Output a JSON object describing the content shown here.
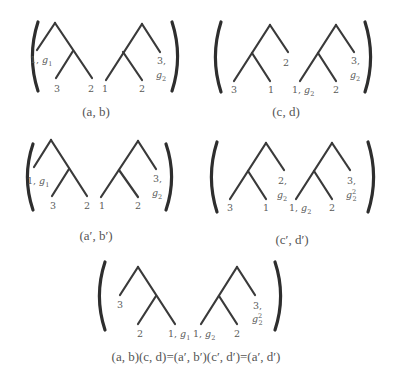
{
  "diagram": {
    "colors": {
      "edge": "#3a3a3a",
      "paren": "#2e2e2e",
      "label": "#5a5a5a",
      "caption": "#555555",
      "background": "#ffffff"
    },
    "panels": [
      {
        "id": "ab",
        "caption": "(a, b)",
        "caption_pos": [
          96,
          116
        ],
        "parens": {
          "left_x": 31,
          "right_x": 179,
          "top": 22,
          "bottom": 91
        },
        "trees": [
          {
            "edges": [
              [
                55,
                23,
                37,
                50
              ],
              [
                55,
                23,
                92,
                78
              ],
              [
                73,
                51,
                56,
                78
              ]
            ],
            "labels": [
              {
                "text": "1, ",
                "sub": "g",
                "subscript": "1",
                "x": 30,
                "y": 63
              },
              {
                "text": "3",
                "x": 54,
                "y": 92
              },
              {
                "text": "2",
                "x": 88,
                "y": 92
              }
            ]
          },
          {
            "edges": [
              [
                142,
                24,
                106,
                80
              ],
              [
                142,
                24,
                160,
                52
              ],
              [
                123,
                52,
                142,
                80
              ]
            ],
            "labels": [
              {
                "text": "1",
                "x": 102,
                "y": 92
              },
              {
                "text": "2",
                "x": 139,
                "y": 92
              },
              {
                "text": "3,",
                "x": 157,
                "y": 64
              },
              {
                "text": "",
                "sub": "g",
                "subscript": "2",
                "x": 156,
                "y": 78
              }
            ]
          }
        ]
      },
      {
        "id": "cd",
        "caption": "(c, d)",
        "caption_pos": [
          286,
          116
        ],
        "parens": {
          "left_x": 214,
          "right_x": 372,
          "top": 22,
          "bottom": 92
        },
        "trees": [
          {
            "edges": [
              [
                270,
                25,
                234,
                81
              ],
              [
                270,
                25,
                288,
                52
              ],
              [
                252,
                53,
                270,
                81
              ]
            ],
            "labels": [
              {
                "text": "3",
                "x": 231,
                "y": 93
              },
              {
                "text": "1",
                "x": 268,
                "y": 93
              },
              {
                "text": "2",
                "x": 283,
                "y": 66
              }
            ]
          },
          {
            "edges": [
              [
                336,
                25,
                300,
                81
              ],
              [
                336,
                25,
                354,
                52
              ],
              [
                318,
                53,
                336,
                81
              ]
            ],
            "labels": [
              {
                "text": "1, ",
                "sub": "g",
                "subscript": "2",
                "x": 292,
                "y": 93
              },
              {
                "text": "2",
                "x": 333,
                "y": 93
              },
              {
                "text": "3,",
                "x": 351,
                "y": 64
              },
              {
                "text": "",
                "sub": "g",
                "subscript": "2",
                "x": 350,
                "y": 78
              }
            ]
          }
        ]
      },
      {
        "id": "a-prime-b-prime",
        "caption": "(a′, b′)",
        "caption_pos": [
          96,
          240
        ],
        "parens": {
          "left_x": 26,
          "right_x": 173,
          "top": 144,
          "bottom": 210
        },
        "trees": [
          {
            "edges": [
              [
                51,
                140,
                34,
                167
              ],
              [
                51,
                140,
                87,
                196
              ],
              [
                69,
                169,
                52,
                196
              ]
            ],
            "labels": [
              {
                "text": "1, ",
                "sub": "g",
                "subscript": "1",
                "x": 27,
                "y": 184
              },
              {
                "text": "3",
                "x": 50,
                "y": 209
              },
              {
                "text": "2",
                "x": 84,
                "y": 209
              }
            ]
          },
          {
            "edges": [
              [
                138,
                141,
                101,
                197
              ],
              [
                138,
                141,
                156,
                169
              ],
              [
                119,
                170,
                138,
                197
              ]
            ],
            "labels": [
              {
                "text": "1",
                "x": 99,
                "y": 209
              },
              {
                "text": "2",
                "x": 135,
                "y": 209
              },
              {
                "text": "3,",
                "x": 153,
                "y": 182
              },
              {
                "text": "",
                "sub": "g",
                "subscript": "2",
                "x": 152,
                "y": 196
              }
            ]
          }
        ]
      },
      {
        "id": "c-prime-d-prime",
        "caption": "(c′, d′)",
        "caption_pos": [
          292,
          244
        ],
        "parens": {
          "left_x": 210,
          "right_x": 375,
          "top": 142,
          "bottom": 212
        },
        "trees": [
          {
            "edges": [
              [
                266,
                143,
                230,
                199
              ],
              [
                266,
                143,
                284,
                170
              ],
              [
                248,
                171,
                266,
                199
              ]
            ],
            "labels": [
              {
                "text": "3",
                "x": 227,
                "y": 211
              },
              {
                "text": "1",
                "x": 263,
                "y": 211
              },
              {
                "text": "2,",
                "x": 278,
                "y": 184
              },
              {
                "text": "",
                "sub": "g",
                "subscript": "2",
                "x": 277,
                "y": 198
              }
            ]
          },
          {
            "edges": [
              [
                332,
                143,
                296,
                199
              ],
              [
                332,
                143,
                350,
                170
              ],
              [
                314,
                171,
                332,
                199
              ]
            ],
            "labels": [
              {
                "text": "1, ",
                "sub": "g",
                "subscript": "2",
                "x": 289,
                "y": 211
              },
              {
                "text": "2",
                "x": 329,
                "y": 211
              },
              {
                "text": "3,",
                "x": 347,
                "y": 184
              },
              {
                "text": "",
                "sub": "g",
                "subscript": "2",
                "sup": "2",
                "x": 346,
                "y": 198
              }
            ]
          }
        ]
      },
      {
        "id": "product",
        "caption": "(a, b)(c, d)=(a′, b′)(c′, d′)=(a′, d′)",
        "caption_pos": [
          196,
          361
        ],
        "parens": {
          "left_x": 98,
          "right_x": 282,
          "top": 262,
          "bottom": 330
        },
        "trees": [
          {
            "edges": [
              [
                138,
                267,
                120,
                295
              ],
              [
                138,
                267,
                175,
                324
              ],
              [
                156,
                296,
                138,
                324
              ]
            ],
            "labels": [
              {
                "text": "3",
                "x": 117,
                "y": 308
              },
              {
                "text": "2",
                "x": 137,
                "y": 337
              },
              {
                "text": "1, ",
                "sub": "g",
                "subscript": "1",
                "x": 168,
                "y": 337
              }
            ]
          },
          {
            "edges": [
              [
                237,
                267,
                201,
                324
              ],
              [
                237,
                267,
                255,
                295
              ],
              [
                219,
                296,
                237,
                324
              ]
            ],
            "labels": [
              {
                "text": "1, ",
                "sub": "g",
                "subscript": "2",
                "x": 193,
                "y": 337
              },
              {
                "text": "2",
                "x": 234,
                "y": 337
              },
              {
                "text": "3,",
                "x": 253,
                "y": 309
              },
              {
                "text": "",
                "sub": "g",
                "subscript": "2",
                "sup": "2",
                "x": 252,
                "y": 322
              }
            ]
          }
        ]
      }
    ]
  }
}
